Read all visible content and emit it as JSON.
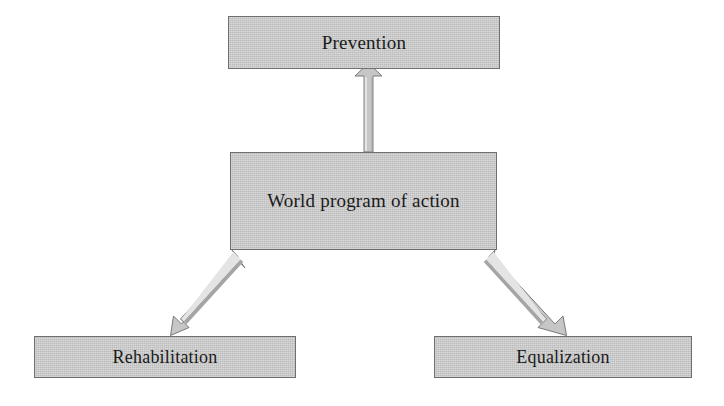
{
  "diagram": {
    "title_text": "World program of action",
    "nodes": [
      {
        "id": "prevention",
        "label": "Prevention"
      },
      {
        "id": "world_program",
        "label": "World program of action"
      },
      {
        "id": "rehabilitation",
        "label": "Rehabilitation"
      },
      {
        "id": "equalization",
        "label": "Equalization"
      }
    ],
    "connectors": [
      {
        "id": "center-to-prevention",
        "from": "world_program",
        "to": "prevention",
        "direction": "up",
        "style": "block-arrow"
      },
      {
        "id": "center-to-rehabilitation",
        "from": "world_program",
        "to": "rehabilitation",
        "direction": "down-left",
        "style": "block-arrow"
      },
      {
        "id": "center-to-equalization",
        "from": "world_program",
        "to": "equalization",
        "direction": "down-right",
        "style": "block-arrow"
      }
    ],
    "colors": {
      "node_fill": "#c9c9c9",
      "node_border": "#6f6f6f",
      "arrow_fill": "#c6c6c6",
      "arrow_border": "#7a7a7a",
      "text": "#1a1a1a",
      "background": "#ffffff"
    }
  }
}
